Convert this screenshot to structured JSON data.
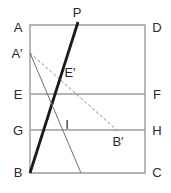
{
  "figure": {
    "type": "geometry-diagram",
    "canvas": {
      "width": 171,
      "height": 193,
      "background": "#ffffff"
    },
    "colors": {
      "rectangle_stroke": "#9a9a9a",
      "horizontal_line_stroke": "#9a9a9a",
      "thick_line_stroke": "#1a1a1a",
      "thin_line_stroke": "#6f6f6f",
      "dashed_line_stroke": "#8a8a8a",
      "label_text": "#2b2b2b"
    },
    "geometry": {
      "rectangle": {
        "corner_A": {
          "x": 30,
          "y": 25
        },
        "corner_D": {
          "x": 145,
          "y": 25
        },
        "corner_C": {
          "x": 145,
          "y": 173
        },
        "corner_B": {
          "x": 30,
          "y": 173
        }
      },
      "point_A_prime": {
        "x": 30,
        "y": 53
      },
      "point_E": {
        "x": 30,
        "y": 94
      },
      "point_F": {
        "x": 145,
        "y": 94
      },
      "point_G": {
        "x": 30,
        "y": 130
      },
      "point_H": {
        "x": 145,
        "y": 130
      },
      "point_P": {
        "x": 78,
        "y": 22
      },
      "point_B_prime": {
        "x": 118,
        "y": 131
      },
      "point_bottom_intersection": {
        "x": 81,
        "y": 173
      }
    },
    "segments": [
      {
        "name": "line-EF",
        "x1": 30,
        "y1": 94,
        "x2": 145,
        "y2": 94,
        "style": "solid",
        "weight": 1.4,
        "color": "#9a9a9a"
      },
      {
        "name": "line-GH",
        "x1": 30,
        "y1": 130,
        "x2": 145,
        "y2": 130,
        "style": "solid",
        "weight": 1.4,
        "color": "#9a9a9a"
      },
      {
        "name": "crease-line-BP",
        "x1": 30,
        "y1": 173,
        "x2": 78,
        "y2": 22,
        "style": "solid",
        "weight": 2.8,
        "color": "#1a1a1a"
      },
      {
        "name": "fold-line-A-prime-B-prime",
        "x1": 30,
        "y1": 53,
        "x2": 118,
        "y2": 131,
        "style": "dashed",
        "weight": 1.0,
        "color": "#8a8a8a"
      },
      {
        "name": "line-A-prime-to-base",
        "x1": 30,
        "y1": 53,
        "x2": 81,
        "y2": 173,
        "style": "solid",
        "weight": 1.0,
        "color": "#6f6f6f"
      }
    ],
    "labels": [
      {
        "name": "label-A",
        "text": "A",
        "x": 18,
        "y": 27
      },
      {
        "name": "label-D",
        "text": "D",
        "x": 157,
        "y": 27
      },
      {
        "name": "label-A-prime",
        "text": "A′",
        "x": 17,
        "y": 53
      },
      {
        "name": "label-E",
        "text": "E",
        "x": 18,
        "y": 94
      },
      {
        "name": "label-F",
        "text": "F",
        "x": 157,
        "y": 94
      },
      {
        "name": "label-G",
        "text": "G",
        "x": 18,
        "y": 130
      },
      {
        "name": "label-H",
        "text": "H",
        "x": 157,
        "y": 130
      },
      {
        "name": "label-B",
        "text": "B",
        "x": 18,
        "y": 172
      },
      {
        "name": "label-C",
        "text": "C",
        "x": 157,
        "y": 172
      },
      {
        "name": "label-P",
        "text": "P",
        "x": 77,
        "y": 12
      },
      {
        "name": "label-E-prime",
        "text": "E′",
        "x": 70,
        "y": 72
      },
      {
        "name": "label-I",
        "text": "I",
        "x": 67,
        "y": 124
      },
      {
        "name": "label-B-prime",
        "text": "B′",
        "x": 118,
        "y": 141
      }
    ]
  }
}
